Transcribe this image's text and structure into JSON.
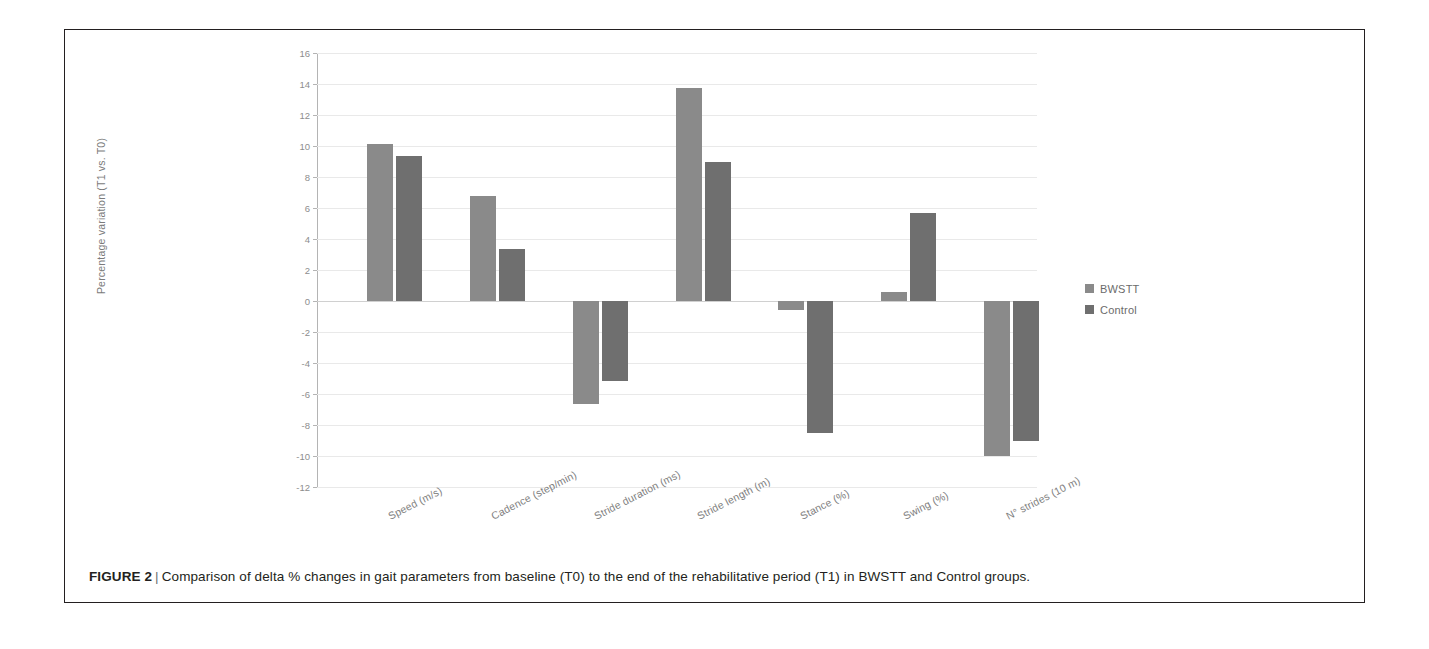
{
  "figure": {
    "label": "FIGURE 2",
    "separator": "|",
    "caption": "Comparison of delta % changes in gait parameters from baseline (T0) to the end of the rehabilitative period (T1) in BWSTT and Control groups."
  },
  "legend": {
    "position": "right",
    "items": [
      {
        "label": "BWSTT",
        "color": "#8a8a8a"
      },
      {
        "label": "Control",
        "color": "#6f6f6f"
      }
    ]
  },
  "chart_data": {
    "type": "bar",
    "title": "",
    "xlabel": "",
    "ylabel": "Percentage variation (T1 vs. T0)",
    "ylim": [
      -12,
      16
    ],
    "yticks": [
      16,
      14,
      12,
      10,
      8,
      6,
      4,
      2,
      0,
      -2,
      -4,
      -6,
      -8,
      -10,
      -12
    ],
    "ytick_labels": [
      "16",
      "14",
      "12",
      "10",
      "8",
      "6",
      "4",
      "2",
      "0",
      "-2",
      "-4",
      "-6",
      "-8",
      "-10",
      "-12"
    ],
    "grid": true,
    "legend_position": "right",
    "categories": [
      "Speed (m/s)",
      "Cadence (step/min)",
      "Stride duration (ms)",
      "Stride length (m)",
      "Stance (%)",
      "Swing (%)",
      "N° strides (10 m)"
    ],
    "series": [
      {
        "name": "BWSTT",
        "color": "#8a8a8a",
        "values": [
          10.1,
          6.75,
          -6.65,
          13.75,
          -0.6,
          0.55,
          -10.0
        ]
      },
      {
        "name": "Control",
        "color": "#6f6f6f",
        "values": [
          9.35,
          3.35,
          -5.15,
          8.95,
          -8.5,
          5.65,
          -9.0
        ]
      }
    ]
  }
}
